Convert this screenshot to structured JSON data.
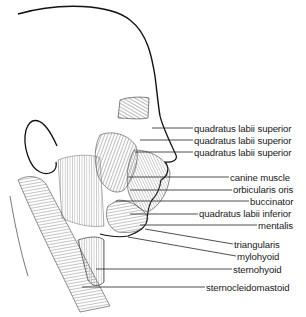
{
  "figure": {
    "labels": [
      {
        "text": "quadratus labii superior",
        "x": 194,
        "y": 123,
        "line": [
          [
            152,
            128
          ],
          [
            193,
            128
          ]
        ]
      },
      {
        "text": "quadratus labii superior",
        "x": 194,
        "y": 135,
        "line": [
          [
            140,
            140
          ],
          [
            193,
            140
          ]
        ]
      },
      {
        "text": "quadratus labii superior",
        "x": 194,
        "y": 147,
        "line": [
          [
            135,
            152
          ],
          [
            193,
            152
          ]
        ]
      },
      {
        "text": "canine muscle",
        "x": 230,
        "y": 172,
        "line": [
          [
            128,
            177
          ],
          [
            229,
            177
          ]
        ]
      },
      {
        "text": "orbicularis oris",
        "x": 233,
        "y": 184,
        "line": [
          [
            130,
            190
          ],
          [
            232,
            190
          ]
        ]
      },
      {
        "text": "buccinator",
        "x": 250,
        "y": 196,
        "line": [
          [
            116,
            201
          ],
          [
            249,
            201
          ]
        ]
      },
      {
        "text": "quadratus labii inferior",
        "x": 199,
        "y": 208,
        "line": [
          [
            130,
            214
          ],
          [
            198,
            214
          ]
        ]
      },
      {
        "text": "mentalis",
        "x": 258,
        "y": 220,
        "line": [
          [
            140,
            225
          ],
          [
            257,
            225
          ]
        ]
      },
      {
        "text": "triangularis",
        "x": 234,
        "y": 239,
        "line": [
          [
            145,
            229
          ],
          [
            233,
            244
          ]
        ]
      },
      {
        "text": "mylohyoid",
        "x": 237,
        "y": 251,
        "line": [
          [
            128,
            237
          ],
          [
            236,
            256
          ]
        ]
      },
      {
        "text": "sternohyoid",
        "x": 233,
        "y": 264,
        "line": [
          [
            96,
            269
          ],
          [
            232,
            269
          ]
        ]
      },
      {
        "text": "sternocleidomastoid",
        "x": 206,
        "y": 282,
        "line": [
          [
            82,
            287
          ],
          [
            205,
            287
          ]
        ]
      }
    ]
  }
}
